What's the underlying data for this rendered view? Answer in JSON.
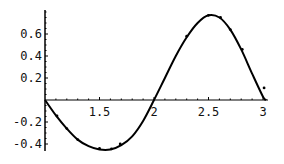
{
  "chart_data": {
    "type": "line",
    "title": "",
    "xlabel": "",
    "ylabel": "",
    "xlim": [
      1.0,
      3.03
    ],
    "ylim": [
      -0.46,
      0.82
    ],
    "grid": false,
    "legend": null,
    "x_ticks": [
      {
        "value": 1.5,
        "label": "1.5"
      },
      {
        "value": 2.0,
        "label": "2"
      },
      {
        "value": 2.5,
        "label": "2.5"
      },
      {
        "value": 3.0,
        "label": "3"
      }
    ],
    "y_ticks": [
      {
        "value": 0.6,
        "label": "0.6"
      },
      {
        "value": 0.4,
        "label": "0.4"
      },
      {
        "value": 0.2,
        "label": "0.2"
      },
      {
        "value": -0.2,
        "label": "-0.2"
      },
      {
        "value": -0.4,
        "label": "-0.4"
      }
    ],
    "series": [
      {
        "name": "fitted curve",
        "kind": "line",
        "color": "#000000",
        "x": [
          1.0,
          1.1,
          1.2,
          1.3,
          1.4,
          1.5,
          1.6,
          1.7,
          1.8,
          1.9,
          2.0,
          2.1,
          2.2,
          2.3,
          2.4,
          2.5,
          2.6,
          2.7,
          2.8,
          2.9,
          3.0,
          3.03
        ],
        "y": [
          0.0,
          -0.14,
          -0.26,
          -0.36,
          -0.42,
          -0.45,
          -0.45,
          -0.41,
          -0.33,
          -0.19,
          0.0,
          0.2,
          0.4,
          0.57,
          0.7,
          0.77,
          0.75,
          0.64,
          0.46,
          0.24,
          0.03,
          0.0
        ]
      },
      {
        "name": "data points",
        "kind": "scatter",
        "color": "#000000",
        "x": [
          1.11,
          1.2,
          1.3,
          1.5,
          1.61,
          1.69,
          2.3,
          2.5,
          2.61,
          2.7,
          2.81,
          3.01
        ],
        "y": [
          -0.145,
          -0.26,
          -0.36,
          -0.44,
          -0.445,
          -0.4,
          0.58,
          0.77,
          0.75,
          0.64,
          0.46,
          0.11
        ]
      }
    ]
  },
  "plot_area": {
    "origin_px": [
      45,
      100
    ],
    "x_scale_px_per_unit": 109,
    "y_scale_px_per_unit": 110,
    "x_axis_end_px": 268,
    "y_axis_top_px": 10,
    "y_axis_bottom_px": 151,
    "minor_tick_step": 0.1
  }
}
